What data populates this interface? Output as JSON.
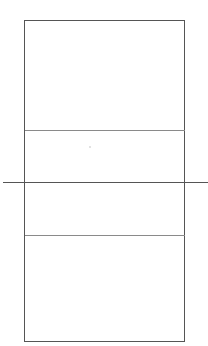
{
  "diagram": {
    "type": "court-outline",
    "colors": {
      "background": "#ffffff",
      "outline": "#555555",
      "inner_lines": "#8a8a8a",
      "dot": "#d8d8d8"
    },
    "elements": [
      {
        "name": "outer-boundary",
        "shape": "rectangle"
      },
      {
        "name": "upper-divider",
        "shape": "line"
      },
      {
        "name": "center-line",
        "shape": "line",
        "extends_beyond_boundary": true
      },
      {
        "name": "lower-divider",
        "shape": "line"
      },
      {
        "name": "center-mark",
        "shape": "dot"
      }
    ]
  }
}
